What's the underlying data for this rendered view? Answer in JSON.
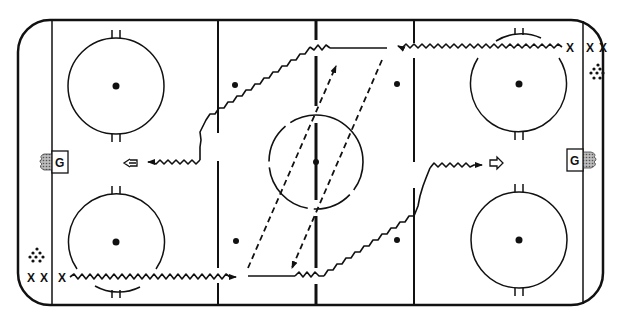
{
  "diagram": {
    "colors": {
      "line": "#111111",
      "background": "#ffffff",
      "puck_fill": "#111111",
      "net_shade": "#888888"
    },
    "rink": {
      "x": 17,
      "y": 20,
      "width": 586,
      "height": 285,
      "corner_radius": 32,
      "goal_lines_x": [
        52,
        583
      ],
      "blue_lines_x": [
        218,
        414
      ],
      "center_line_x": 316,
      "center_circle": {
        "cx": 316,
        "cy": 162,
        "r": 48
      },
      "faceoff_circles": [
        {
          "cx": 116,
          "cy": 86,
          "r": 48
        },
        {
          "cx": 116,
          "cy": 242,
          "r": 48
        },
        {
          "cx": 519,
          "cy": 84,
          "r": 48
        },
        {
          "cx": 519,
          "cy": 240,
          "r": 48
        }
      ],
      "neutral_dots": [
        {
          "cx": 235,
          "cy": 85
        },
        {
          "cx": 397,
          "cy": 84
        },
        {
          "cx": 236,
          "cy": 241
        },
        {
          "cx": 397,
          "cy": 240
        },
        {
          "cx": 316,
          "cy": 162
        }
      ]
    },
    "goalies": [
      {
        "label": "G",
        "side": "left",
        "x": 53,
        "y": 150
      },
      {
        "label": "G",
        "side": "right",
        "x": 567,
        "y": 150
      }
    ],
    "players": {
      "top_right_label": "X",
      "top_right_extra": [
        "X",
        "X"
      ],
      "bottom_left_label": "X",
      "bottom_left_extra": [
        "X",
        "X"
      ]
    },
    "pucks": [
      {
        "position": "top-right",
        "cx": 597,
        "cy": 72
      },
      {
        "position": "bottom-left",
        "cx": 37,
        "cy": 255
      }
    ],
    "legend_symbols": {
      "skating_path": "wavy line with arrow",
      "pass": "dashed line with arrow",
      "skate_without_puck": "open arrow"
    }
  }
}
